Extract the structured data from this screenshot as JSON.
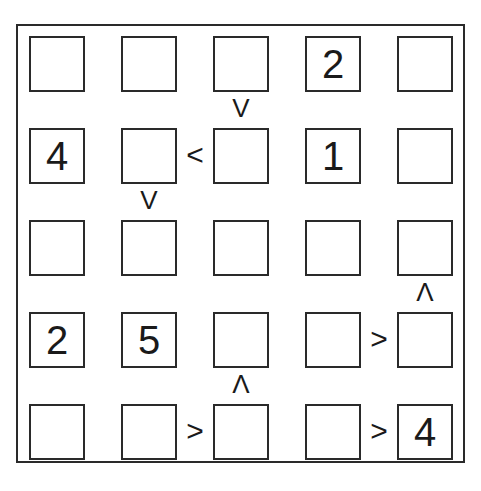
{
  "puzzle": {
    "type": "futoshiki",
    "size": 5,
    "grid": [
      [
        "",
        "",
        "",
        "2",
        ""
      ],
      [
        "4",
        "",
        "",
        "1",
        ""
      ],
      [
        "",
        "",
        "",
        "",
        ""
      ],
      [
        "2",
        "5",
        "",
        "",
        ""
      ],
      [
        "",
        "",
        "",
        "",
        "4"
      ]
    ],
    "constraints": [
      {
        "between": [
          [
            0,
            2
          ],
          [
            1,
            2
          ]
        ],
        "symbol": "v",
        "orientation": "vertical"
      },
      {
        "between": [
          [
            1,
            1
          ],
          [
            1,
            2
          ]
        ],
        "symbol": "<",
        "orientation": "horizontal"
      },
      {
        "between": [
          [
            1,
            1
          ],
          [
            2,
            1
          ]
        ],
        "symbol": "v",
        "orientation": "vertical"
      },
      {
        "between": [
          [
            2,
            4
          ],
          [
            3,
            4
          ]
        ],
        "symbol": "^",
        "orientation": "vertical"
      },
      {
        "between": [
          [
            3,
            3
          ],
          [
            3,
            4
          ]
        ],
        "symbol": ">",
        "orientation": "horizontal"
      },
      {
        "between": [
          [
            3,
            2
          ],
          [
            4,
            2
          ]
        ],
        "symbol": "^",
        "orientation": "vertical"
      },
      {
        "between": [
          [
            4,
            1
          ],
          [
            4,
            2
          ]
        ],
        "symbol": ">",
        "orientation": "horizontal"
      },
      {
        "between": [
          [
            4,
            3
          ],
          [
            4,
            4
          ]
        ],
        "symbol": ">",
        "orientation": "horizontal"
      }
    ]
  }
}
